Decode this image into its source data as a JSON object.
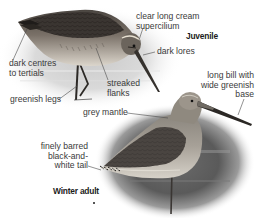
{
  "figure": {
    "juvenile": {
      "title": "Juvenile",
      "labels": {
        "supercilium": "clear long cream\nsupercilium",
        "lores": "dark lores",
        "tertials": "dark centres\nto tertials",
        "flanks": "streaked\nflanks",
        "legs": "greenish legs"
      }
    },
    "winter_adult": {
      "title": "Winter adult",
      "labels": {
        "bill": "long bill with\nwide greenish\nbase",
        "mantle": "grey mantle",
        "tail": "finely barred\nblack-and-\nwhite tail"
      }
    }
  },
  "colors": {
    "label_text": "#3a3a3a",
    "leader_line": "#4a4a4a",
    "bird_dark": "#2e2b28",
    "bird_mid": "#6e6860",
    "bird_light": "#b9b3a8",
    "background_fade": "#cfcfcf"
  }
}
